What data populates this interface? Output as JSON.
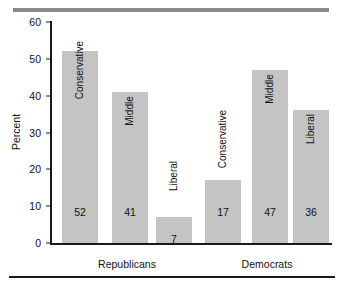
{
  "chart_data": {
    "type": "bar",
    "title": "",
    "xlabel": "",
    "ylabel": "Percent",
    "ylim": [
      0,
      60
    ],
    "yticks": [
      0,
      10,
      20,
      30,
      40,
      50,
      60
    ],
    "grid": false,
    "legend": "none",
    "groups": [
      "Republicans",
      "Democrats"
    ],
    "categories": [
      "Conservative",
      "Middle",
      "Liberal"
    ],
    "series": [
      {
        "name": "Republicans",
        "values": [
          52,
          41,
          7
        ]
      },
      {
        "name": "Democrats",
        "values": [
          17,
          47,
          36
        ]
      }
    ],
    "bars": [
      {
        "group": "Republicans",
        "category": "Conservative",
        "value": 52,
        "label_position": "inside"
      },
      {
        "group": "Republicans",
        "category": "Middle",
        "value": 41,
        "label_position": "inside"
      },
      {
        "group": "Republicans",
        "category": "Liberal",
        "value": 7,
        "label_position": "above"
      },
      {
        "group": "Democrats",
        "category": "Conservative",
        "value": 17,
        "label_position": "above"
      },
      {
        "group": "Democrats",
        "category": "Middle",
        "value": 47,
        "label_position": "inside"
      },
      {
        "group": "Democrats",
        "category": "Liberal",
        "value": 36,
        "label_position": "inside"
      }
    ]
  },
  "style": {
    "bar_color": "#c4c4c4",
    "axis_color": "#1a1a1a",
    "top_rule_color": "#8a8a8a",
    "text_color": "#111111",
    "background": "#ffffff"
  }
}
